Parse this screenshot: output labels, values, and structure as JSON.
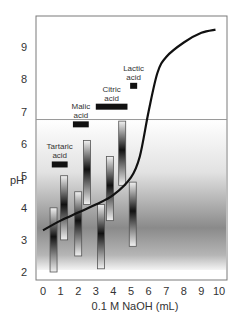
{
  "chart_data": {
    "type": "line",
    "title": "",
    "xlabel": "0.1 M NaOH (mL)",
    "ylabel": "pH",
    "xlim": [
      0,
      10
    ],
    "ylim": [
      2,
      9.6
    ],
    "x_ticks": [
      "0",
      "1",
      "2",
      "3",
      "4",
      "5",
      "6",
      "7",
      "8",
      "9",
      "10"
    ],
    "y_ticks": [
      "2",
      "3",
      "4",
      "5",
      "6",
      "7",
      "8",
      "9"
    ],
    "grid": false,
    "reference_line": {
      "pH": 6.75
    },
    "series": [
      {
        "name": "Titration curve",
        "x": [
          0,
          1,
          2,
          3,
          4,
          5,
          5.5,
          6,
          6.5,
          7,
          8,
          9,
          9.8
        ],
        "y": [
          3.3,
          3.6,
          3.85,
          4.1,
          4.4,
          4.95,
          5.6,
          7.0,
          8.2,
          8.7,
          9.15,
          9.45,
          9.55
        ]
      }
    ],
    "range_bars": [
      {
        "x": 0.6,
        "low": 2.0,
        "high": 4.0
      },
      {
        "x": 1.2,
        "low": 3.0,
        "high": 5.0
      },
      {
        "x": 2.0,
        "low": 2.5,
        "high": 4.5
      },
      {
        "x": 2.5,
        "low": 4.1,
        "high": 6.1
      },
      {
        "x": 3.3,
        "low": 2.1,
        "high": 4.1
      },
      {
        "x": 3.8,
        "low": 3.6,
        "high": 5.6
      },
      {
        "x": 4.5,
        "low": 4.7,
        "high": 6.7
      },
      {
        "x": 5.1,
        "low": 2.8,
        "high": 4.8
      }
    ],
    "annotations": [
      {
        "label_line1": "Tartaric",
        "label_line2": "acid",
        "x_start": 0.5,
        "x_end": 1.4,
        "pH": 5.35
      },
      {
        "label_line1": "Malic",
        "label_line2": "acid",
        "x_start": 1.7,
        "x_end": 2.6,
        "pH": 6.6
      },
      {
        "label_line1": "Citric",
        "label_line2": "acid",
        "x_start": 3.0,
        "x_end": 4.8,
        "pH": 7.15
      },
      {
        "label_line1": "Lactic",
        "label_line2": "acid",
        "x_start": 4.95,
        "x_end": 5.35,
        "pH": 7.8
      }
    ]
  }
}
